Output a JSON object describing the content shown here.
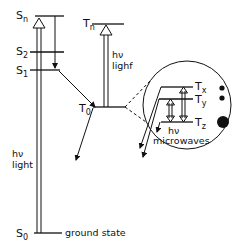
{
  "diagram": {
    "singlet_levels": [
      {
        "symbol": "S",
        "sub": "n"
      },
      {
        "symbol": "S",
        "sub": "2"
      },
      {
        "symbol": "S",
        "sub": "1"
      },
      {
        "symbol": "S",
        "sub": "0"
      }
    ],
    "triplet_levels": [
      {
        "symbol": "T",
        "sub": "n"
      },
      {
        "symbol": "T",
        "sub": "0"
      }
    ],
    "sublevels": [
      {
        "symbol": "T",
        "sub": "x"
      },
      {
        "symbol": "T",
        "sub": "y"
      },
      {
        "symbol": "T",
        "sub": "z"
      }
    ],
    "labels": {
      "hv_left": "hν",
      "light_left": "light",
      "hv_right": "hν",
      "light_right": "lighf",
      "hv_micro": "hν",
      "microwaves": "microwaves",
      "ground_state": "ground state"
    },
    "colors": {
      "ink": "#111111",
      "background": "#ffffff"
    }
  }
}
